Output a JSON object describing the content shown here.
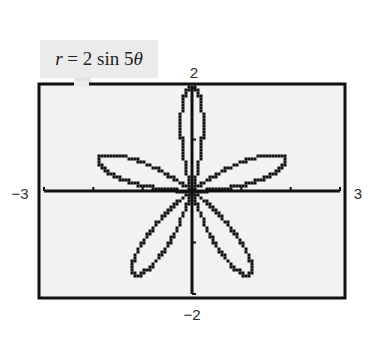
{
  "chart_data": {
    "type": "line",
    "subtype": "polar-rose",
    "title": "",
    "equation": "r = 2 sin 5θ",
    "equation_parts": {
      "lhs": "r",
      "eq": " = 2 sin 5",
      "theta": "θ"
    },
    "function": {
      "form": "r = a sin(nθ)",
      "a": 2,
      "n": 5,
      "theta_range": [
        0,
        3.14159265
      ]
    },
    "petals": {
      "count": 5,
      "length": 2,
      "tip_angles_deg": [
        18,
        90,
        162,
        234,
        306
      ]
    },
    "xlabel": "",
    "ylabel": "",
    "xlim": [
      -3,
      3
    ],
    "ylim": [
      -2,
      2
    ],
    "xticks": [
      -3,
      -2,
      -1,
      0,
      1,
      2,
      3
    ],
    "yticks": [
      -2,
      -1,
      0,
      1,
      2
    ],
    "window_labels": {
      "xmin": "−3",
      "xmax": "3",
      "ymin": "−2",
      "ymax": "2"
    },
    "grid": false,
    "legend": null,
    "style": {
      "render": "graphing-calculator pixel plot",
      "line_color": "#111111",
      "background": "#f2f2f2",
      "frame_color": "#111111"
    }
  },
  "labels": {
    "xmin": "−3",
    "xmax": "3",
    "ymin": "−2",
    "ymax": "2"
  },
  "callout": {
    "lhs": "r",
    "rest": " = 2 sin 5",
    "theta": "θ"
  }
}
